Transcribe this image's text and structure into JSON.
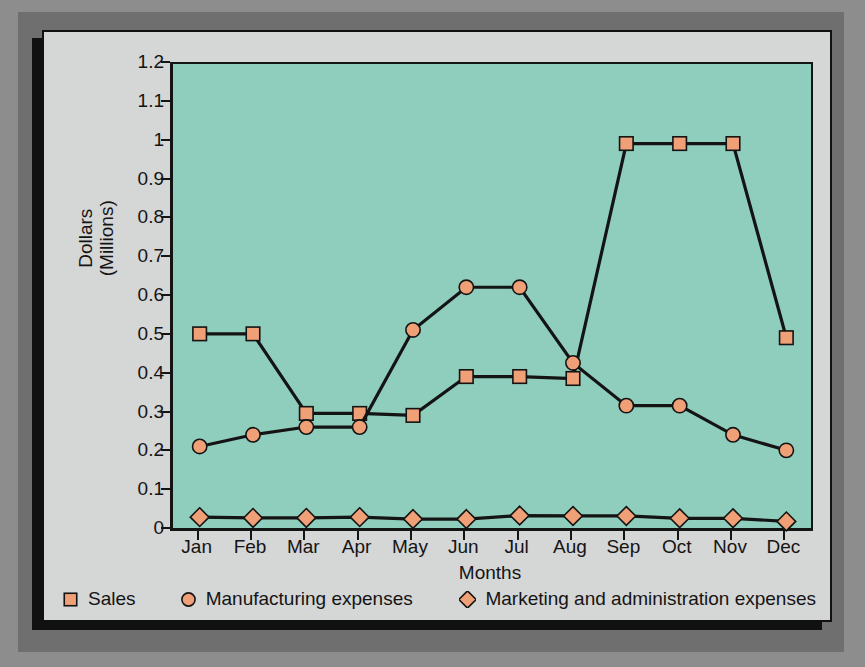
{
  "chart_data": {
    "type": "line",
    "title": "",
    "xlabel": "Months",
    "ylabel": "Dollars\n(Millions)",
    "ylabel_line1": "Dollars",
    "ylabel_line2": "(Millions)",
    "categories": [
      "Jan",
      "Feb",
      "Mar",
      "Apr",
      "May",
      "Jun",
      "Jul",
      "Aug",
      "Sep",
      "Oct",
      "Nov",
      "Dec"
    ],
    "ylim": [
      0,
      1.2
    ],
    "yticks": [
      0,
      0.1,
      0.2,
      0.3,
      0.4,
      0.5,
      0.6,
      0.7,
      0.8,
      0.9,
      1,
      1.1,
      1.2
    ],
    "ytick_labels": [
      "0",
      "0.1",
      "0.2",
      "0.3",
      "0.4",
      "0.5",
      "0.6",
      "0.7",
      "0.8",
      "0.9",
      "1",
      "1.1",
      "1.2"
    ],
    "grid": false,
    "legend_position": "bottom",
    "plot_background": "#8fcdbd",
    "marker_fill": "#f0a077",
    "line_color": "#141414",
    "series": [
      {
        "name": "Sales",
        "marker": "square",
        "values": [
          0.5,
          0.5,
          0.295,
          0.295,
          0.29,
          0.39,
          0.39,
          0.385,
          0.99,
          0.99,
          0.99,
          0.49
        ]
      },
      {
        "name": "Manufacturing expenses",
        "marker": "circle",
        "values": [
          0.21,
          0.24,
          0.26,
          0.26,
          0.51,
          0.62,
          0.62,
          0.425,
          0.315,
          0.315,
          0.24,
          0.2
        ]
      },
      {
        "name": "Marketing and administration expenses",
        "marker": "diamond",
        "values": [
          0.028,
          0.026,
          0.026,
          0.028,
          0.023,
          0.023,
          0.032,
          0.031,
          0.031,
          0.025,
          0.025,
          0.017
        ]
      }
    ]
  }
}
